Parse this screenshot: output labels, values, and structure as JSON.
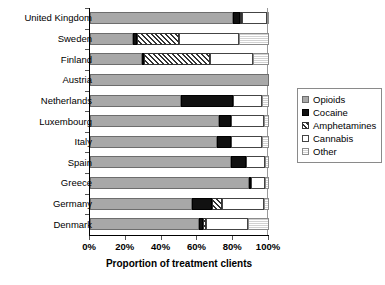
{
  "chart_data": {
    "type": "bar",
    "orientation": "horizontal",
    "stacked": true,
    "title": "",
    "xlabel": "Proportion of treatment clients",
    "ylabel": "",
    "xlim": [
      0,
      100
    ],
    "xticks": [
      "0%",
      "20%",
      "40%",
      "60%",
      "80%",
      "100%"
    ],
    "xtick_values": [
      0,
      20,
      40,
      60,
      80,
      100
    ],
    "grid": false,
    "legend_position": "right",
    "categories": [
      "United Kingdom",
      "Sweden",
      "Finland",
      "Austria",
      "Netherlands",
      "Luxembourg",
      "Italy",
      "Spain",
      "Greece",
      "Germany",
      "Denmark"
    ],
    "series": [
      {
        "name": "Opioids",
        "key": "op",
        "values": [
          80,
          24,
          29,
          100,
          51,
          72,
          71,
          79,
          89,
          57,
          61
        ]
      },
      {
        "name": "Cocaine",
        "key": "co",
        "values": [
          4,
          2,
          1,
          0,
          29,
          7,
          8,
          8,
          1,
          11,
          2
        ]
      },
      {
        "name": "Amphetamines",
        "key": "am",
        "values": [
          1,
          24,
          37,
          0,
          0,
          0,
          0,
          0,
          0,
          6,
          2
        ]
      },
      {
        "name": "Cannabis",
        "key": "ca",
        "values": [
          14,
          33,
          24,
          0,
          16,
          18,
          17,
          11,
          8,
          23,
          23
        ]
      },
      {
        "name": "Other",
        "key": "ot",
        "values": [
          1,
          17,
          9,
          0,
          4,
          3,
          4,
          2,
          2,
          3,
          12
        ]
      }
    ]
  },
  "legend": {
    "items": [
      {
        "label": "Opioids",
        "key": "op"
      },
      {
        "label": "Cocaine",
        "key": "co"
      },
      {
        "label": "Amphetamines",
        "key": "am"
      },
      {
        "label": "Cannabis",
        "key": "ca"
      },
      {
        "label": "Other",
        "key": "ot"
      }
    ]
  }
}
